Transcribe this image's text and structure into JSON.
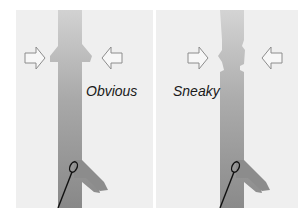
{
  "figure": {
    "panels": [
      {
        "id": "left",
        "label": "Obvious",
        "defect": "protruding collar"
      },
      {
        "id": "right",
        "label": "Sneaky",
        "defect": "subtle notch"
      }
    ],
    "colors": {
      "background": "#efefef",
      "vessel_top": "#c9c9c9",
      "vessel_bottom": "#8a8a8a",
      "arrow_stroke": "#8c8c8c",
      "catheter": "#111111"
    }
  }
}
